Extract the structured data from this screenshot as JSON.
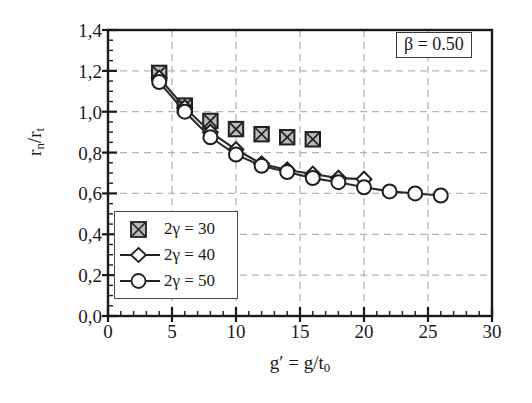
{
  "chart_data": {
    "type": "scatter",
    "title": "",
    "xlabel": "g' = g/t0",
    "xlabel_html": "g&prime; = g/t<sub>0</sub>",
    "ylabel": "rn/rt",
    "ylabel_html": "r<sub>n</sub>/r<sub>t</sub>",
    "xlim": [
      0,
      30
    ],
    "ylim": [
      0.0,
      1.4
    ],
    "xticks": [
      0,
      5,
      10,
      15,
      20,
      25,
      30
    ],
    "xticklabels": [
      "0",
      "5",
      "10",
      "15",
      "20",
      "25",
      "30"
    ],
    "yticks": [
      0.0,
      0.2,
      0.4,
      0.6,
      0.8,
      1.0,
      1.2,
      1.4
    ],
    "yticklabels": [
      "0,0",
      "0,2",
      "0,4",
      "0,6",
      "0,8",
      "1,0",
      "1,2",
      "1,4"
    ],
    "x_minor_tick_step": 1,
    "y_minor_tick_step": 0.05,
    "grid": true,
    "grid_style": "dashed",
    "grid_color": "#b5b5b5",
    "legend_position": "lower-left-inside",
    "annotation": "β = 0.50",
    "series": [
      {
        "name": "2γ = 30",
        "marker": "crossed-square",
        "line": false,
        "points": [
          {
            "x": 4,
            "y": 1.19
          },
          {
            "x": 6,
            "y": 1.03
          },
          {
            "x": 8,
            "y": 0.955
          },
          {
            "x": 10,
            "y": 0.915
          },
          {
            "x": 12,
            "y": 0.89
          },
          {
            "x": 14,
            "y": 0.875
          },
          {
            "x": 16,
            "y": 0.865
          }
        ]
      },
      {
        "name": "2γ = 40",
        "marker": "diamond",
        "line": true,
        "points": [
          {
            "x": 4,
            "y": 1.165
          },
          {
            "x": 6,
            "y": 1.02
          },
          {
            "x": 8,
            "y": 0.9
          },
          {
            "x": 10,
            "y": 0.815
          },
          {
            "x": 12,
            "y": 0.745
          },
          {
            "x": 14,
            "y": 0.715
          },
          {
            "x": 16,
            "y": 0.695
          },
          {
            "x": 18,
            "y": 0.675
          },
          {
            "x": 20,
            "y": 0.67
          }
        ]
      },
      {
        "name": "2γ = 50",
        "marker": "circle",
        "line": true,
        "points": [
          {
            "x": 4,
            "y": 1.145
          },
          {
            "x": 6,
            "y": 1.0
          },
          {
            "x": 8,
            "y": 0.875
          },
          {
            "x": 10,
            "y": 0.79
          },
          {
            "x": 12,
            "y": 0.735
          },
          {
            "x": 14,
            "y": 0.705
          },
          {
            "x": 16,
            "y": 0.675
          },
          {
            "x": 18,
            "y": 0.655
          },
          {
            "x": 20,
            "y": 0.63
          },
          {
            "x": 22,
            "y": 0.61
          },
          {
            "x": 24,
            "y": 0.6
          },
          {
            "x": 26,
            "y": 0.59
          }
        ]
      }
    ]
  },
  "legend": {
    "items": [
      {
        "label": "2γ = 30",
        "marker": "crossed-square"
      },
      {
        "label": "2γ = 40",
        "marker": "diamond"
      },
      {
        "label": "2γ = 50",
        "marker": "circle"
      }
    ]
  },
  "annotation": {
    "beta_text": "β = 0.50"
  },
  "colors": {
    "axis": "#1a1a1a",
    "grid": "#b5b5b5",
    "series_line": "#2b2b2b",
    "marker_fill": "#ffffff",
    "background": "#ffffff"
  }
}
